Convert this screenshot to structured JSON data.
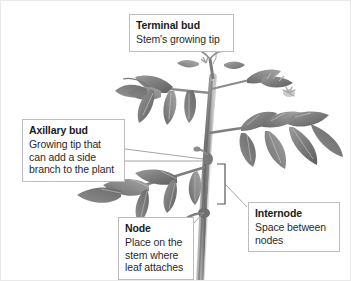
{
  "figure": {
    "background_color": "#ffffff",
    "border_color": "#e9e9e9",
    "illustration_style": "grayscale-botanical-drawing",
    "leader_line_color": "#9a9a9a",
    "callout_border_color": "#bdbdbd"
  },
  "callouts": [
    {
      "id": "terminal-bud",
      "term": "Terminal bud",
      "description": "Stem's growing tip"
    },
    {
      "id": "axillary-bud",
      "term": "Axillary bud",
      "description": "Growing tip that can add a side branch to the plant"
    },
    {
      "id": "node",
      "term": "Node",
      "description": "Place on the stem where leaf attaches"
    },
    {
      "id": "internode",
      "term": "Internode",
      "description": "Space between nodes"
    }
  ],
  "plant": {
    "stem_color": "#8e8e8e",
    "leaf_color": "#8a8a8a",
    "leaf_dark": "#6f6f6f",
    "flower_color": "#b9b9b9"
  }
}
